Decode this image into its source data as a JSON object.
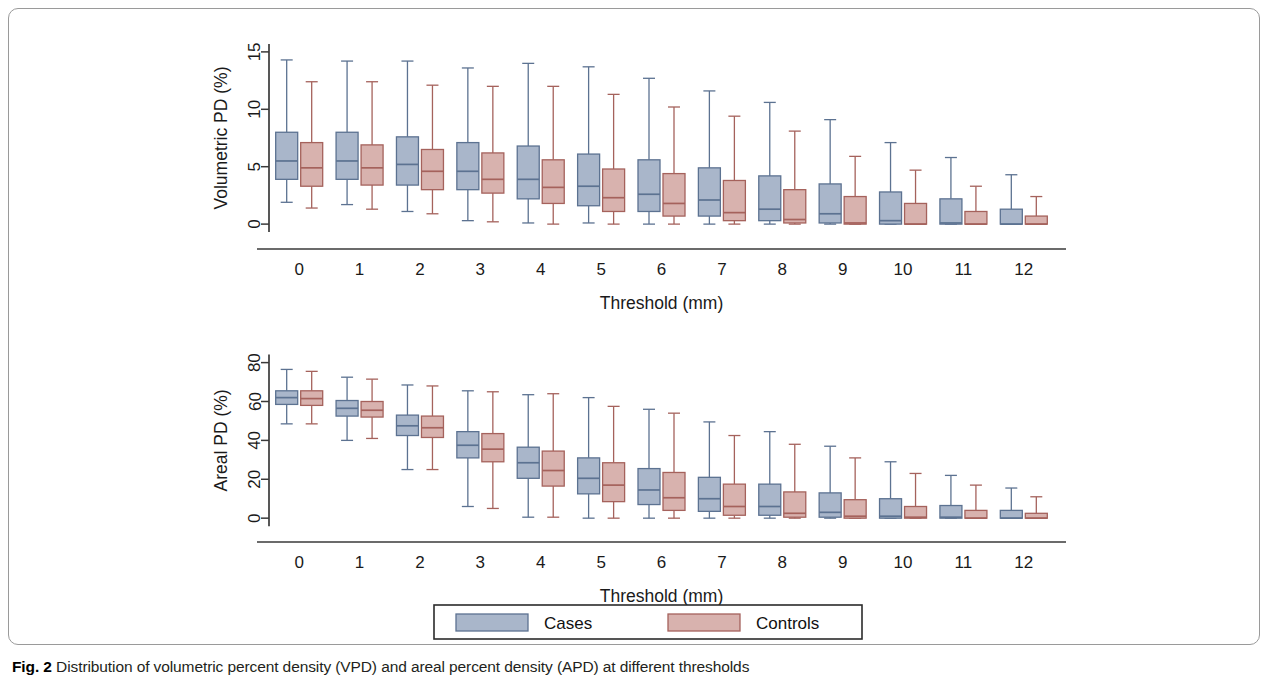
{
  "figure": {
    "caption_label": "Fig. 2",
    "caption_text": "Distribution of volumetric percent density (VPD) and areal percent density (APD) at different thresholds"
  },
  "legend": {
    "items": [
      {
        "label": "Cases",
        "fill": "#a9b6ca",
        "stroke": "#5c7291"
      },
      {
        "label": "Controls",
        "fill": "#d8b2ae",
        "stroke": "#a5625c"
      }
    ]
  },
  "colors": {
    "cases_fill": "#a9b6ca",
    "cases_stroke": "#5c7291",
    "controls_fill": "#d8b2ae",
    "controls_stroke": "#a5625c",
    "axis": "#3a3a3a",
    "panel_border": "#9a9a9a",
    "text": "#1a1a1a"
  },
  "chart_data": [
    {
      "type": "box",
      "id": "volumetric-pd",
      "title": "",
      "xlabel": "Threshold (mm)",
      "ylabel": "Volumetric PD (%)",
      "categories": [
        "0",
        "1",
        "2",
        "3",
        "4",
        "5",
        "6",
        "7",
        "8",
        "9",
        "10",
        "11",
        "12"
      ],
      "xticklabels": [
        "0",
        "1",
        "2",
        "3",
        "4",
        "5",
        "6",
        "7",
        "8",
        "9",
        "10",
        "11",
        "12"
      ],
      "yticks": [
        0,
        5,
        10,
        15
      ],
      "yticklabels": [
        "0",
        "5",
        "10",
        "15"
      ],
      "ylim": [
        -0.6,
        15.6
      ],
      "grid": false,
      "legend_position": "bottom",
      "series": [
        {
          "name": "Cases",
          "boxes": [
            {
              "x": "0",
              "whisker_low": 1.9,
              "q1": 3.9,
              "median": 5.5,
              "q3": 8.0,
              "whisker_high": 14.3
            },
            {
              "x": "1",
              "whisker_low": 1.7,
              "q1": 3.9,
              "median": 5.5,
              "q3": 8.0,
              "whisker_high": 14.2
            },
            {
              "x": "2",
              "whisker_low": 1.1,
              "q1": 3.4,
              "median": 5.2,
              "q3": 7.6,
              "whisker_high": 14.2
            },
            {
              "x": "3",
              "whisker_low": 0.3,
              "q1": 3.0,
              "median": 4.6,
              "q3": 7.1,
              "whisker_high": 13.6
            },
            {
              "x": "4",
              "whisker_low": 0.1,
              "q1": 2.2,
              "median": 3.9,
              "q3": 6.8,
              "whisker_high": 14.0
            },
            {
              "x": "5",
              "whisker_low": 0.1,
              "q1": 1.6,
              "median": 3.3,
              "q3": 6.1,
              "whisker_high": 13.7
            },
            {
              "x": "6",
              "whisker_low": 0.0,
              "q1": 1.1,
              "median": 2.6,
              "q3": 5.6,
              "whisker_high": 12.7
            },
            {
              "x": "7",
              "whisker_low": 0.0,
              "q1": 0.7,
              "median": 2.1,
              "q3": 4.9,
              "whisker_high": 11.6
            },
            {
              "x": "8",
              "whisker_low": 0.0,
              "q1": 0.3,
              "median": 1.3,
              "q3": 4.2,
              "whisker_high": 10.6
            },
            {
              "x": "9",
              "whisker_low": 0.0,
              "q1": 0.1,
              "median": 0.9,
              "q3": 3.5,
              "whisker_high": 9.1
            },
            {
              "x": "10",
              "whisker_low": 0.0,
              "q1": 0.0,
              "median": 0.3,
              "q3": 2.8,
              "whisker_high": 7.1
            },
            {
              "x": "11",
              "whisker_low": 0.0,
              "q1": 0.0,
              "median": 0.1,
              "q3": 2.2,
              "whisker_high": 5.8
            },
            {
              "x": "12",
              "whisker_low": 0.0,
              "q1": 0.0,
              "median": 0.0,
              "q3": 1.3,
              "whisker_high": 4.3
            }
          ]
        },
        {
          "name": "Controls",
          "boxes": [
            {
              "x": "0",
              "whisker_low": 1.4,
              "q1": 3.3,
              "median": 4.9,
              "q3": 7.1,
              "whisker_high": 12.4
            },
            {
              "x": "1",
              "whisker_low": 1.3,
              "q1": 3.4,
              "median": 4.9,
              "q3": 6.9,
              "whisker_high": 12.4
            },
            {
              "x": "2",
              "whisker_low": 0.9,
              "q1": 3.0,
              "median": 4.6,
              "q3": 6.5,
              "whisker_high": 12.1
            },
            {
              "x": "3",
              "whisker_low": 0.2,
              "q1": 2.7,
              "median": 3.9,
              "q3": 6.2,
              "whisker_high": 12.0
            },
            {
              "x": "4",
              "whisker_low": 0.0,
              "q1": 1.8,
              "median": 3.2,
              "q3": 5.6,
              "whisker_high": 12.0
            },
            {
              "x": "5",
              "whisker_low": 0.0,
              "q1": 1.1,
              "median": 2.3,
              "q3": 4.8,
              "whisker_high": 11.3
            },
            {
              "x": "6",
              "whisker_low": 0.0,
              "q1": 0.7,
              "median": 1.8,
              "q3": 4.4,
              "whisker_high": 10.2
            },
            {
              "x": "7",
              "whisker_low": 0.0,
              "q1": 0.3,
              "median": 1.0,
              "q3": 3.8,
              "whisker_high": 9.4
            },
            {
              "x": "8",
              "whisker_low": 0.0,
              "q1": 0.1,
              "median": 0.4,
              "q3": 3.0,
              "whisker_high": 8.1
            },
            {
              "x": "9",
              "whisker_low": 0.0,
              "q1": 0.0,
              "median": 0.1,
              "q3": 2.4,
              "whisker_high": 5.9
            },
            {
              "x": "10",
              "whisker_low": 0.0,
              "q1": 0.0,
              "median": 0.0,
              "q3": 1.8,
              "whisker_high": 4.7
            },
            {
              "x": "11",
              "whisker_low": 0.0,
              "q1": 0.0,
              "median": 0.0,
              "q3": 1.1,
              "whisker_high": 3.3
            },
            {
              "x": "12",
              "whisker_low": 0.0,
              "q1": 0.0,
              "median": 0.0,
              "q3": 0.7,
              "whisker_high": 2.4
            }
          ]
        }
      ]
    },
    {
      "type": "box",
      "id": "areal-pd",
      "title": "",
      "xlabel": "Threshold (mm)",
      "ylabel": "Areal PD (%)",
      "categories": [
        "0",
        "1",
        "2",
        "3",
        "4",
        "5",
        "6",
        "7",
        "8",
        "9",
        "10",
        "11",
        "12"
      ],
      "xticklabels": [
        "0",
        "1",
        "2",
        "3",
        "4",
        "5",
        "6",
        "7",
        "8",
        "9",
        "10",
        "11",
        "12"
      ],
      "yticks": [
        0,
        20,
        40,
        60,
        80
      ],
      "yticklabels": [
        "0",
        "20",
        "40",
        "60",
        "80"
      ],
      "ylim": [
        -3,
        87
      ],
      "grid": false,
      "legend_position": "bottom",
      "series": [
        {
          "name": "Cases",
          "boxes": [
            {
              "x": "0",
              "whisker_low": 48.5,
              "q1": 58.5,
              "median": 62.0,
              "q3": 65.5,
              "whisker_high": 76.5
            },
            {
              "x": "1",
              "whisker_low": 40.0,
              "q1": 52.5,
              "median": 56.5,
              "q3": 60.5,
              "whisker_high": 72.5
            },
            {
              "x": "2",
              "whisker_low": 25.0,
              "q1": 42.5,
              "median": 47.5,
              "q3": 53.0,
              "whisker_high": 68.5
            },
            {
              "x": "3",
              "whisker_low": 6.0,
              "q1": 31.0,
              "median": 37.5,
              "q3": 44.5,
              "whisker_high": 65.5
            },
            {
              "x": "4",
              "whisker_low": 0.5,
              "q1": 20.5,
              "median": 28.5,
              "q3": 36.5,
              "whisker_high": 63.5
            },
            {
              "x": "5",
              "whisker_low": 0.0,
              "q1": 12.5,
              "median": 20.5,
              "q3": 31.0,
              "whisker_high": 62.0
            },
            {
              "x": "6",
              "whisker_low": 0.0,
              "q1": 7.0,
              "median": 14.5,
              "q3": 25.5,
              "whisker_high": 56.0
            },
            {
              "x": "7",
              "whisker_low": 0.0,
              "q1": 3.5,
              "median": 10.0,
              "q3": 21.0,
              "whisker_high": 49.5
            },
            {
              "x": "8",
              "whisker_low": 0.0,
              "q1": 1.5,
              "median": 6.0,
              "q3": 17.5,
              "whisker_high": 44.5
            },
            {
              "x": "9",
              "whisker_low": 0.0,
              "q1": 0.5,
              "median": 3.0,
              "q3": 13.0,
              "whisker_high": 37.0
            },
            {
              "x": "10",
              "whisker_low": 0.0,
              "q1": 0.0,
              "median": 1.0,
              "q3": 10.0,
              "whisker_high": 29.0
            },
            {
              "x": "11",
              "whisker_low": 0.0,
              "q1": 0.0,
              "median": 0.5,
              "q3": 6.5,
              "whisker_high": 22.0
            },
            {
              "x": "12",
              "whisker_low": 0.0,
              "q1": 0.0,
              "median": 0.0,
              "q3": 4.0,
              "whisker_high": 15.5
            }
          ]
        },
        {
          "name": "Controls",
          "boxes": [
            {
              "x": "0",
              "whisker_low": 48.5,
              "q1": 58.0,
              "median": 61.5,
              "q3": 65.5,
              "whisker_high": 75.5
            },
            {
              "x": "1",
              "whisker_low": 41.0,
              "q1": 52.0,
              "median": 55.5,
              "q3": 60.0,
              "whisker_high": 71.5
            },
            {
              "x": "2",
              "whisker_low": 25.0,
              "q1": 41.5,
              "median": 46.5,
              "q3": 52.5,
              "whisker_high": 68.0
            },
            {
              "x": "3",
              "whisker_low": 5.0,
              "q1": 29.0,
              "median": 35.5,
              "q3": 43.5,
              "whisker_high": 65.0
            },
            {
              "x": "4",
              "whisker_low": 0.5,
              "q1": 16.5,
              "median": 24.5,
              "q3": 34.5,
              "whisker_high": 64.0
            },
            {
              "x": "5",
              "whisker_low": 0.0,
              "q1": 8.5,
              "median": 17.0,
              "q3": 28.5,
              "whisker_high": 57.5
            },
            {
              "x": "6",
              "whisker_low": 0.0,
              "q1": 4.0,
              "median": 10.5,
              "q3": 23.5,
              "whisker_high": 54.0
            },
            {
              "x": "7",
              "whisker_low": 0.0,
              "q1": 1.5,
              "median": 6.0,
              "q3": 17.5,
              "whisker_high": 42.5
            },
            {
              "x": "8",
              "whisker_low": 0.0,
              "q1": 0.5,
              "median": 2.5,
              "q3": 13.5,
              "whisker_high": 38.0
            },
            {
              "x": "9",
              "whisker_low": 0.0,
              "q1": 0.0,
              "median": 1.0,
              "q3": 9.5,
              "whisker_high": 31.0
            },
            {
              "x": "10",
              "whisker_low": 0.0,
              "q1": 0.0,
              "median": 0.5,
              "q3": 6.0,
              "whisker_high": 23.0
            },
            {
              "x": "11",
              "whisker_low": 0.0,
              "q1": 0.0,
              "median": 0.0,
              "q3": 4.0,
              "whisker_high": 17.0
            },
            {
              "x": "12",
              "whisker_low": 0.0,
              "q1": 0.0,
              "median": 0.0,
              "q3": 2.5,
              "whisker_high": 11.0
            }
          ]
        }
      ]
    }
  ]
}
